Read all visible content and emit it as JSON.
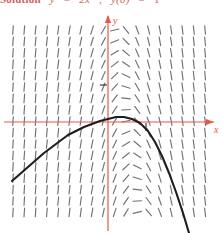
{
  "figure": {
    "kind": "slope-field-with-solution-curve",
    "title_prefix": "Solution",
    "equation_lhs": "y",
    "equation_eq": "=",
    "equation_rhs": "2x",
    "equation_sep": ",",
    "initial_lhs": "y(",
    "initial_arg": "0",
    "initial_rhs": ")",
    "initial_eq": "=",
    "initial_val": "1"
  },
  "axes": {
    "x_label": "x",
    "y_label": "y",
    "axis_color": "#e8564a",
    "origin_px": {
      "x": 108,
      "y": 122
    },
    "x_tick_px": 146,
    "y_tick_px": 85,
    "x_range": [
      -3.2,
      3.2
    ],
    "y_range": [
      -2.4,
      2.6
    ]
  },
  "field": {
    "stroke": "#555b60",
    "cols": 18,
    "rows": 17,
    "x0": 13,
    "y0": 30,
    "dx": 11.3,
    "dy": 11.4,
    "seg_len": 8.6,
    "description": "direction field: steep positive slopes at left, flattening to zero along a ridge, steeply negative at lower right"
  },
  "curve": {
    "stroke": "#1d1d1d",
    "width": 2.1,
    "description": "solution curve rising from lower-left, peaking just above the x-axis near x=0.9, then falling steeply to the lower right",
    "points": [
      [
        12,
        181
      ],
      [
        20,
        174
      ],
      [
        28,
        167
      ],
      [
        36,
        160
      ],
      [
        44,
        153
      ],
      [
        52,
        147
      ],
      [
        60,
        141
      ],
      [
        68,
        135
      ],
      [
        76,
        131
      ],
      [
        84,
        127
      ],
      [
        92,
        124
      ],
      [
        100,
        121
      ],
      [
        108,
        119
      ],
      [
        116,
        117
      ],
      [
        124,
        117
      ],
      [
        132,
        119
      ],
      [
        140,
        123
      ],
      [
        148,
        131
      ],
      [
        155,
        142
      ],
      [
        162,
        156
      ],
      [
        169,
        173
      ],
      [
        176,
        192
      ],
      [
        183,
        213
      ],
      [
        189,
        233
      ]
    ]
  }
}
